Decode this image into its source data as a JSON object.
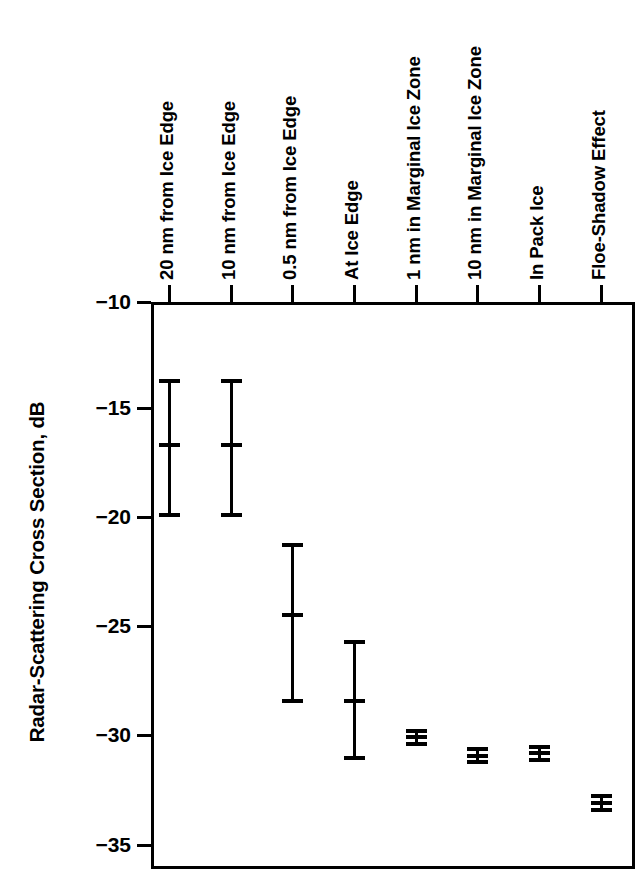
{
  "chart_data": {
    "type": "scatter",
    "title": "",
    "xlabel": "",
    "ylabel": "Radar-Scattering Cross Section, dB",
    "ylim": [
      -35,
      -10
    ],
    "yticks": [
      "−10",
      "−15",
      "−20",
      "−25",
      "−30",
      "−35"
    ],
    "ytick_values": [
      -10,
      -15,
      -20,
      -25,
      -30,
      -35
    ],
    "grid": false,
    "legend": "none",
    "categories": [
      "20 nm from Ice Edge",
      "10 nm from Ice Edge",
      "0.5 nm from Ice Edge",
      "At Ice Edge",
      "1 nm in Marginal Ice Zone",
      "10 nm in Marginal Ice Zone",
      "In Pack Ice",
      "Floe-Shadow Effect"
    ],
    "series": [
      {
        "name": "Radar-scattering cross section",
        "values": [
          -16.3,
          -16.3,
          -23.8,
          -27.6,
          -29.2,
          -30.0,
          -29.9,
          -32.1
        ],
        "upper": [
          -13.5,
          -13.5,
          -20.7,
          -25.0,
          -28.9,
          -29.7,
          -29.6,
          -31.8
        ],
        "lower": [
          -19.4,
          -19.4,
          -27.6,
          -30.1,
          -29.5,
          -30.3,
          -30.2,
          -32.4
        ]
      }
    ]
  }
}
